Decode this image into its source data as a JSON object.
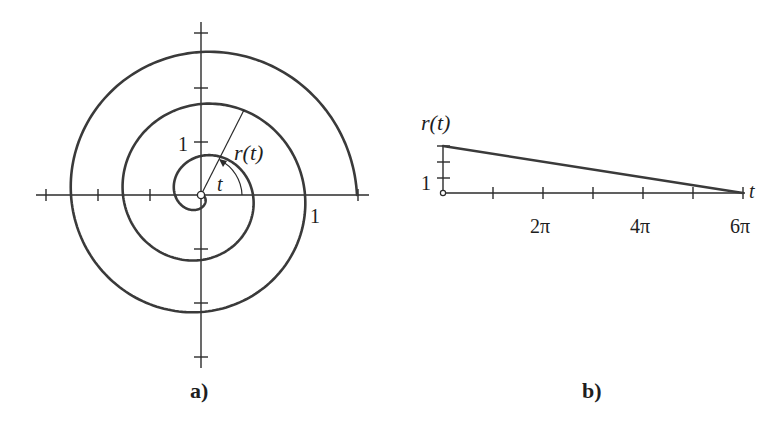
{
  "figure": {
    "panel_a": {
      "caption": "a)",
      "x_tick_label": "1",
      "y_tick_label": "1",
      "radius_label": "r(t)",
      "angle_label": "t"
    },
    "panel_b": {
      "caption": "b)",
      "y_axis_label": "r(t)",
      "x_axis_label": "t",
      "y_tick_label": "1",
      "x_tick_labels": [
        "2π",
        "4π",
        "6π"
      ]
    }
  },
  "chart_data": [
    {
      "type": "line",
      "title": "a) Polar spiral",
      "description": "Spiral r(t) = 3 - t/(2π) plotted in polar coordinates for t in [0, 6π]",
      "r_formula": "3 - t/(2*pi)",
      "t_range": [
        0,
        18.85
      ],
      "xlim": [
        -3,
        3
      ],
      "ylim": [
        -3,
        3
      ],
      "x_ticks": [
        -3,
        -2,
        -1,
        3
      ],
      "y_ticks": [
        -3,
        -2,
        -1,
        1,
        2,
        3
      ],
      "labels": [
        "1",
        "1",
        "r(t)",
        "t"
      ],
      "grid": false
    },
    {
      "type": "line",
      "title": "b) r(t) versus t",
      "xlabel": "t",
      "ylabel": "r(t)",
      "x": [
        0,
        18.85
      ],
      "values": [
        3,
        0
      ],
      "x_ticks": [
        "π",
        "2π",
        "3π",
        "4π",
        "5π",
        "6π"
      ],
      "x_tick_labels_shown": [
        "2π",
        "4π",
        "6π"
      ],
      "y_ticks": [
        1,
        2,
        3
      ],
      "y_tick_labels_shown": [
        "1"
      ],
      "xlim": [
        0,
        18.85
      ],
      "ylim": [
        0,
        3
      ],
      "grid": false
    }
  ]
}
